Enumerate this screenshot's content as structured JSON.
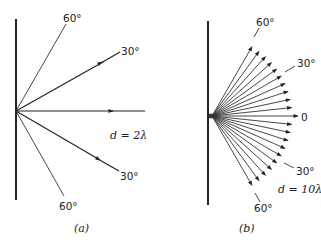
{
  "panels": [
    {
      "id": "a",
      "caption": "(a)",
      "spacing_label": "d = 2λ",
      "angle_labels": {
        "top_60": "60°",
        "top_30": "30°",
        "bottom_30": "30°",
        "bottom_60": "60°"
      },
      "beams_deg": [
        60,
        30,
        0,
        -30,
        -60
      ]
    },
    {
      "id": "b",
      "caption": "(b)",
      "spacing_label": "d = 10λ",
      "angle_labels": {
        "top_60": "60°",
        "top_30": "30°",
        "zero": "0",
        "bottom_30": "30°",
        "bottom_60": "60°"
      },
      "beams_deg": [
        60,
        54,
        48,
        42,
        36,
        30,
        24,
        18,
        12,
        6,
        0,
        -6,
        -12,
        -18,
        -24,
        -30,
        -36,
        -42,
        -48,
        -54,
        -60
      ]
    }
  ],
  "colors": {
    "ink": "#222222",
    "background": "#ffffff"
  }
}
